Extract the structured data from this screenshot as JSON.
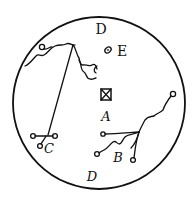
{
  "diagram": {
    "type": "circular-field-illustration",
    "ink_color": "#111111",
    "background": "#ffffff",
    "labels": {
      "top": "D",
      "bottom": "D",
      "e": "E",
      "a": "A",
      "b": "B",
      "c": "C"
    }
  }
}
